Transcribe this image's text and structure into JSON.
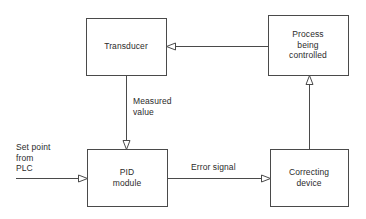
{
  "diagram": {
    "line_color": "#4a4a4a",
    "text_color": "#2b2b2b",
    "background_color": "#ffffff",
    "nodes": [
      {
        "id": "transducer",
        "label": "Transducer",
        "x": 86,
        "y": 18,
        "width": 80,
        "height": 57
      },
      {
        "id": "process",
        "label": "Process\nbeing\ncontrolled",
        "x": 268,
        "y": 15,
        "width": 80,
        "height": 60
      },
      {
        "id": "pid",
        "label": "PID\nmodule",
        "x": 87,
        "y": 149,
        "width": 80,
        "height": 57
      },
      {
        "id": "correcting",
        "label": "Correcting\ndevice",
        "x": 270,
        "y": 149,
        "width": 78,
        "height": 57
      }
    ],
    "edges": [
      {
        "id": "process-to-transducer",
        "label": "",
        "from": "process",
        "to": "transducer",
        "direction": "left"
      },
      {
        "id": "transducer-to-pid",
        "label": "Measured\nvalue",
        "from": "transducer",
        "to": "pid",
        "direction": "down"
      },
      {
        "id": "setpoint-to-pid",
        "label": "Set point\nfrom\nPLC",
        "from": "external-plc",
        "to": "pid",
        "direction": "right"
      },
      {
        "id": "pid-to-correcting",
        "label": "Error signal",
        "from": "pid",
        "to": "correcting",
        "direction": "right"
      },
      {
        "id": "correcting-to-process",
        "label": "",
        "from": "correcting",
        "to": "process",
        "direction": "up"
      }
    ]
  }
}
